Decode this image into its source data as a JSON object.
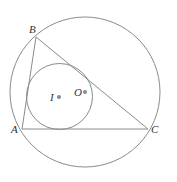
{
  "diagram": {
    "stroke_color": "#8a8a8a",
    "dot_color": "#8a8a8a",
    "points": {
      "A": {
        "label": "A",
        "x": 22,
        "y": 129
      },
      "B": {
        "label": "B",
        "x": 36,
        "y": 37
      },
      "C": {
        "label": "C",
        "x": 148,
        "y": 129
      },
      "I": {
        "label": "I",
        "x": 59,
        "y": 97
      },
      "O": {
        "label": "O",
        "x": 85,
        "y": 92
      }
    },
    "circumcircle": {
      "cx": 85,
      "cy": 92,
      "r": 75
    },
    "incircle": {
      "cx": 59.5,
      "cy": 96.5,
      "r": 33
    }
  }
}
